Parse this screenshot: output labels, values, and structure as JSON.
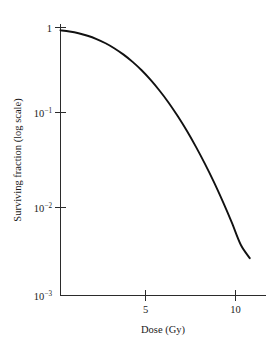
{
  "chart_data": {
    "type": "line",
    "title": "",
    "subtitle": "",
    "xlabel": "Dose (Gy)",
    "ylabel": "Surviving fraction (log scale)",
    "yscale": "log",
    "xscale": "linear",
    "xlim": [
      0,
      11.4
    ],
    "ylim": [
      0.001,
      1
    ],
    "grid": false,
    "legend": null,
    "x_ticks": [
      {
        "value": 5,
        "label": "5"
      },
      {
        "value": 10,
        "label": "10"
      }
    ],
    "y_ticks": [
      {
        "value": 1,
        "label": "1",
        "mantissa": "1",
        "exponent": ""
      },
      {
        "value": 0.1,
        "label": "10-1",
        "mantissa": "10",
        "exponent": "−1"
      },
      {
        "value": 0.01,
        "label": "10-2",
        "mantissa": "10",
        "exponent": "−2"
      },
      {
        "value": 0.001,
        "label": "10-3",
        "mantissa": "10",
        "exponent": "−3"
      }
    ],
    "series": [
      {
        "name": "Cell survival curve",
        "color": "#111111",
        "x": [
          0.0,
          0.5,
          1.0,
          1.5,
          2.0,
          2.5,
          3.0,
          3.5,
          4.0,
          4.5,
          5.0,
          5.5,
          6.0,
          6.5,
          7.0,
          7.5,
          8.0,
          8.5,
          9.0,
          9.5,
          10.0,
          10.5
        ],
        "y": [
          0.93,
          0.902,
          0.862,
          0.808,
          0.742,
          0.666,
          0.583,
          0.497,
          0.412,
          0.332,
          0.259,
          0.196,
          0.144,
          0.102,
          0.0702,
          0.0467,
          0.0301,
          0.0188,
          0.0113,
          0.00658,
          0.0037,
          0.00262
        ]
      }
    ]
  },
  "axes": {
    "x_axis_label": "Dose (Gy)",
    "y_axis_label": "Surviving fraction (log scale)"
  },
  "colors": {
    "curve": "#111111",
    "axis": "#2b2b2b",
    "background": "#ffffff",
    "text": "#1a1a1a"
  }
}
